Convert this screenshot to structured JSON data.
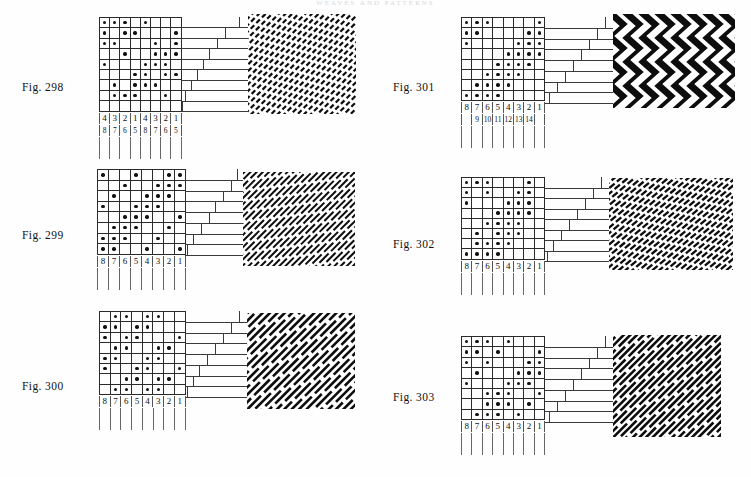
{
  "page": {
    "running_head": "WEAVES AND PATTERNS",
    "width": 751,
    "height": 477,
    "ink_color": "#111111",
    "rule_color": "#2b2b2b",
    "paper_color": "#fefefe"
  },
  "figures": [
    {
      "id": "fig-298",
      "label": "Fig. 298",
      "label_x": 22,
      "label_y": 81,
      "grid_x": 99,
      "grid_y": 17,
      "cell_w": 10.2,
      "cell_h": 10.4,
      "cols": 8,
      "rows": 9,
      "pattern": [
        [
          1,
          1,
          1,
          0,
          1,
          0,
          0,
          0
        ],
        [
          1,
          0,
          1,
          1,
          0,
          0,
          0,
          1
        ],
        [
          1,
          1,
          0,
          0,
          0,
          1,
          0,
          1
        ],
        [
          0,
          0,
          1,
          0,
          0,
          1,
          1,
          1
        ],
        [
          1,
          0,
          0,
          0,
          1,
          1,
          1,
          0
        ],
        [
          0,
          0,
          0,
          1,
          1,
          0,
          1,
          1
        ],
        [
          0,
          1,
          0,
          1,
          1,
          1,
          0,
          0
        ],
        [
          0,
          1,
          1,
          1,
          0,
          0,
          1,
          0
        ],
        [
          0,
          0,
          0,
          0,
          0,
          0,
          0,
          0
        ]
      ],
      "numbers_top": [
        "4",
        "3",
        "2",
        "1",
        "4",
        "3",
        "2",
        "1"
      ],
      "numbers_bottom": [
        "8",
        "7",
        "6",
        "5",
        "8",
        "7",
        "6",
        "5"
      ],
      "steps_x": 181,
      "steps_y": 17,
      "steps_w": 67,
      "steps_h": 94,
      "step_rows": 9,
      "step_ticks": [
        58,
        44,
        36,
        28,
        22,
        16,
        10,
        4,
        1
      ],
      "swatch_x": 248,
      "swatch_y": 14,
      "swatch_w": 108,
      "swatch_h": 100,
      "swatch_style": "twill-dense-zigzag",
      "swatch_angle": -45,
      "swatch_period": 6
    },
    {
      "id": "fig-299",
      "label": "Fig. 299",
      "label_x": 22,
      "label_y": 229,
      "grid_x": 97,
      "grid_y": 169,
      "cell_w": 11.0,
      "cell_h": 10.6,
      "cols": 8,
      "rows": 8,
      "pattern": [
        [
          1,
          0,
          0,
          1,
          0,
          0,
          1,
          1
        ],
        [
          0,
          0,
          1,
          0,
          0,
          1,
          1,
          1
        ],
        [
          0,
          1,
          0,
          0,
          1,
          1,
          1,
          0
        ],
        [
          1,
          0,
          0,
          1,
          1,
          1,
          0,
          0
        ],
        [
          0,
          0,
          1,
          1,
          1,
          0,
          0,
          1
        ],
        [
          0,
          1,
          1,
          1,
          0,
          0,
          1,
          0
        ],
        [
          1,
          1,
          1,
          0,
          0,
          1,
          0,
          0
        ],
        [
          1,
          1,
          0,
          0,
          1,
          0,
          0,
          1
        ]
      ],
      "numbers_top": [
        "8",
        "7",
        "6",
        "5",
        "4",
        "3",
        "2",
        "1"
      ],
      "numbers_bottom": [],
      "steps_x": 185,
      "steps_y": 169,
      "steps_w": 58,
      "steps_h": 86,
      "step_rows": 8,
      "step_ticks": [
        52,
        46,
        38,
        30,
        24,
        16,
        8,
        2
      ],
      "swatch_x": 243,
      "swatch_y": 172,
      "swatch_w": 112,
      "swatch_h": 94,
      "swatch_style": "twill-diagonal",
      "swatch_angle": -45,
      "swatch_period": 7
    },
    {
      "id": "fig-300",
      "label": "Fig. 300",
      "label_x": 22,
      "label_y": 380,
      "grid_x": 99,
      "grid_y": 311,
      "cell_w": 10.7,
      "cell_h": 10.4,
      "cols": 8,
      "rows": 8,
      "pattern": [
        [
          0,
          1,
          1,
          0,
          1,
          1,
          0,
          0
        ],
        [
          1,
          1,
          0,
          1,
          1,
          0,
          0,
          0
        ],
        [
          1,
          0,
          1,
          1,
          0,
          0,
          0,
          1
        ],
        [
          0,
          1,
          1,
          0,
          0,
          1,
          1,
          0
        ],
        [
          1,
          1,
          0,
          0,
          1,
          1,
          0,
          0
        ],
        [
          1,
          0,
          0,
          1,
          1,
          0,
          0,
          1
        ],
        [
          0,
          0,
          1,
          1,
          0,
          1,
          1,
          0
        ],
        [
          0,
          1,
          1,
          0,
          1,
          1,
          0,
          0
        ]
      ],
      "numbers_top": [
        "8",
        "7",
        "6",
        "5",
        "4",
        "3",
        "2",
        "1"
      ],
      "numbers_bottom": [],
      "steps_x": 185,
      "steps_y": 311,
      "steps_w": 62,
      "steps_h": 86,
      "step_rows": 8,
      "step_ticks": [
        54,
        46,
        38,
        30,
        22,
        14,
        8,
        2
      ],
      "swatch_x": 247,
      "swatch_y": 313,
      "swatch_w": 108,
      "swatch_h": 96,
      "swatch_style": "twill-broad-diagonal",
      "swatch_angle": -45,
      "swatch_period": 9
    },
    {
      "id": "fig-301",
      "label": "Fig. 301",
      "label_x": 393,
      "label_y": 81,
      "grid_x": 461,
      "grid_y": 17,
      "cell_w": 10.4,
      "cell_h": 10.4,
      "cols": 8,
      "rows": 8,
      "pattern": [
        [
          1,
          1,
          1,
          0,
          0,
          0,
          0,
          1
        ],
        [
          1,
          1,
          0,
          0,
          0,
          0,
          1,
          1
        ],
        [
          1,
          0,
          0,
          0,
          0,
          1,
          1,
          1
        ],
        [
          0,
          0,
          0,
          0,
          1,
          1,
          1,
          1
        ],
        [
          0,
          0,
          0,
          1,
          1,
          1,
          1,
          0
        ],
        [
          0,
          0,
          1,
          1,
          1,
          1,
          0,
          0
        ],
        [
          0,
          1,
          1,
          1,
          1,
          0,
          0,
          0
        ],
        [
          1,
          1,
          1,
          1,
          0,
          0,
          0,
          0
        ]
      ],
      "numbers_top": [
        "8",
        "7",
        "6",
        "5",
        "4",
        "3",
        "2",
        "1"
      ],
      "numbers_bottom": [
        "",
        "9",
        "10",
        "11",
        "12",
        "13",
        "14",
        ""
      ],
      "steps_x": 545,
      "steps_y": 17,
      "steps_w": 68,
      "steps_h": 86,
      "step_rows": 8,
      "step_ticks": [
        60,
        52,
        44,
        36,
        28,
        20,
        12,
        4
      ],
      "swatch_x": 613,
      "swatch_y": 14,
      "swatch_w": 122,
      "swatch_h": 94,
      "swatch_style": "zigzag-bold",
      "swatch_angle": 0,
      "swatch_period": 8
    },
    {
      "id": "fig-302",
      "label": "Fig. 302",
      "label_x": 393,
      "label_y": 238,
      "grid_x": 461,
      "grid_y": 177,
      "cell_w": 10.4,
      "cell_h": 10.2,
      "cols": 8,
      "rows": 8,
      "pattern": [
        [
          1,
          1,
          1,
          0,
          0,
          0,
          1,
          0
        ],
        [
          1,
          0,
          1,
          0,
          0,
          1,
          1,
          0
        ],
        [
          1,
          0,
          0,
          0,
          1,
          1,
          1,
          0
        ],
        [
          0,
          0,
          0,
          1,
          1,
          1,
          1,
          0
        ],
        [
          0,
          0,
          1,
          1,
          1,
          1,
          0,
          0
        ],
        [
          0,
          1,
          0,
          1,
          1,
          1,
          0,
          0
        ],
        [
          0,
          1,
          1,
          1,
          1,
          0,
          0,
          0
        ],
        [
          1,
          1,
          1,
          1,
          0,
          0,
          0,
          0
        ]
      ],
      "numbers_top": [
        "8",
        "7",
        "6",
        "5",
        "4",
        "3",
        "2",
        "1"
      ],
      "numbers_bottom": [],
      "steps_x": 545,
      "steps_y": 177,
      "steps_w": 64,
      "steps_h": 84,
      "step_rows": 8,
      "step_ticks": [
        56,
        48,
        40,
        32,
        24,
        16,
        8,
        2
      ],
      "swatch_x": 609,
      "swatch_y": 178,
      "swatch_w": 124,
      "swatch_h": 92,
      "swatch_style": "twill-hatch-steep",
      "swatch_angle": -40,
      "swatch_period": 6
    },
    {
      "id": "fig-303",
      "label": "Fig. 303",
      "label_x": 393,
      "label_y": 391,
      "grid_x": 461,
      "grid_y": 336,
      "cell_w": 10.4,
      "cell_h": 10.4,
      "cols": 8,
      "rows": 8,
      "pattern": [
        [
          1,
          1,
          1,
          0,
          1,
          0,
          0,
          0
        ],
        [
          1,
          1,
          0,
          1,
          0,
          0,
          0,
          1
        ],
        [
          1,
          0,
          1,
          0,
          0,
          0,
          1,
          1
        ],
        [
          0,
          1,
          0,
          0,
          0,
          1,
          1,
          1
        ],
        [
          1,
          0,
          0,
          0,
          1,
          1,
          1,
          0
        ],
        [
          0,
          0,
          1,
          1,
          1,
          0,
          0,
          1
        ],
        [
          0,
          0,
          1,
          1,
          1,
          0,
          1,
          0
        ],
        [
          0,
          1,
          1,
          1,
          0,
          1,
          0,
          0
        ]
      ],
      "numbers_top": [
        "8",
        "7",
        "6",
        "5",
        "4",
        "3",
        "2",
        "1"
      ],
      "numbers_bottom": [],
      "steps_x": 545,
      "steps_y": 336,
      "steps_w": 68,
      "steps_h": 86,
      "step_rows": 8,
      "step_ticks": [
        60,
        52,
        44,
        36,
        28,
        20,
        12,
        4
      ],
      "swatch_x": 613,
      "swatch_y": 335,
      "swatch_w": 108,
      "swatch_h": 102,
      "swatch_style": "twill-broad-diagonal",
      "swatch_angle": -45,
      "swatch_period": 8
    }
  ]
}
